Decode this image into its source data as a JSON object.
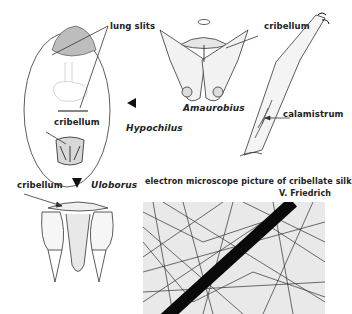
{
  "figure": {
    "labels": {
      "lung_slits": "lung slits",
      "cribellum_hypochilus": "cribellum",
      "hypochilus": "Hypochilus",
      "amaurobius": "Amaurobius",
      "cribellum_leg": "cribellum",
      "calamistrum": "calamistrum",
      "cribellum_uloborus": "cribellum",
      "uloborus": "Uloborus",
      "micrograph_caption": "electron microscope picture of cribellate silk",
      "credit": "V. Friedrich"
    },
    "panels": [
      {
        "name": "Hypochilus",
        "view": "ventral abdomen outline with lung slits and cribellum"
      },
      {
        "name": "Amaurobius",
        "view": "spinnerets with cribellum"
      },
      {
        "name": "leg",
        "view": "metatarsus with calamistrum"
      },
      {
        "name": "Uloborus",
        "view": "spinnerets with cribellum"
      },
      {
        "name": "micrograph",
        "view": "electron microscope picture of cribellate silk"
      }
    ],
    "colors": {
      "ink": "#1a1a1a",
      "paper": "#ffffff",
      "micro_bg": "#e9e9e9"
    }
  }
}
